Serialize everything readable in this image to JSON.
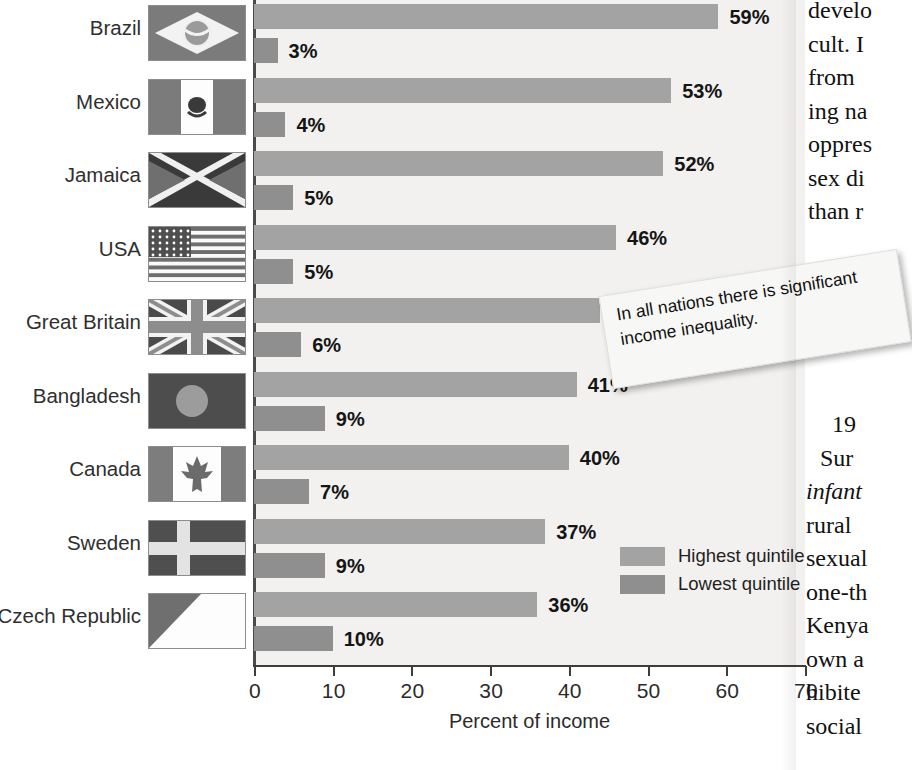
{
  "chart_data": {
    "type": "bar",
    "title": "",
    "xlabel": "Percent of income",
    "ylabel": "",
    "xlim": [
      0,
      70
    ],
    "orientation": "horizontal",
    "grid": false,
    "legend_position": "inside-right",
    "categories": [
      "Brazil",
      "Mexico",
      "Jamaica",
      "USA",
      "Great Britain",
      "Bangladesh",
      "Canada",
      "Sweden",
      "Czech Republic"
    ],
    "tick_labels": [
      "0",
      "10",
      "20",
      "30",
      "40",
      "50",
      "60",
      "70"
    ],
    "tick_values": [
      0,
      10,
      20,
      30,
      40,
      50,
      60,
      70
    ],
    "series": [
      {
        "name": "Highest quintile",
        "color": "#a3a3a3",
        "values": [
          59,
          53,
          52,
          46,
          44,
          41,
          40,
          37,
          36
        ],
        "labels": [
          "59%",
          "53%",
          "52%",
          "46%",
          "44%",
          "41%",
          "40%",
          "37%",
          "36%"
        ]
      },
      {
        "name": "Lowest quintile",
        "color": "#8f8f8f",
        "values": [
          3,
          4,
          5,
          5,
          6,
          9,
          7,
          9,
          10
        ],
        "labels": [
          "3%",
          "4%",
          "5%",
          "5%",
          "6%",
          "9%",
          "7%",
          "9%",
          "10%"
        ]
      }
    ],
    "annotations": [
      "In all nations there is significant income inequality."
    ]
  },
  "axis": {
    "x_title": "Percent of income",
    "ticks": [
      "0",
      "10",
      "20",
      "30",
      "40",
      "50",
      "60",
      "70"
    ]
  },
  "rows": [
    {
      "country": "Brazil",
      "flag": "flag-brazil",
      "high": 59,
      "high_label": "59%",
      "low": 3,
      "low_label": "3%"
    },
    {
      "country": "Mexico",
      "flag": "flag-mexico",
      "high": 53,
      "high_label": "53%",
      "low": 4,
      "low_label": "4%"
    },
    {
      "country": "Jamaica",
      "flag": "flag-jamaica",
      "high": 52,
      "high_label": "52%",
      "low": 5,
      "low_label": "5%"
    },
    {
      "country": "USA",
      "flag": "flag-usa",
      "high": 46,
      "high_label": "46%",
      "low": 5,
      "low_label": "5%"
    },
    {
      "country": "Great Britain",
      "flag": "flag-great-britain",
      "high": 44,
      "high_label": "44%",
      "low": 6,
      "low_label": "6%"
    },
    {
      "country": "Bangladesh",
      "flag": "flag-bangladesh",
      "high": 41,
      "high_label": "41%",
      "low": 9,
      "low_label": "9%"
    },
    {
      "country": "Canada",
      "flag": "flag-canada",
      "high": 40,
      "high_label": "40%",
      "low": 7,
      "low_label": "7%"
    },
    {
      "country": "Sweden",
      "flag": "flag-sweden",
      "high": 37,
      "high_label": "37%",
      "low": 9,
      "low_label": "9%"
    },
    {
      "country": "Czech Republic",
      "flag": "flag-czech-republic",
      "high": 36,
      "high_label": "36%",
      "low": 10,
      "low_label": "10%"
    }
  ],
  "legend": {
    "items": [
      {
        "label": "Highest quintile",
        "color": "#a3a3a3"
      },
      {
        "label": "Lowest quintile",
        "color": "#8f8f8f"
      }
    ]
  },
  "callout": {
    "text": "In all nations there is significant income inequality."
  },
  "book_text": {
    "top_lines": [
      "develo",
      "cult. I",
      "from",
      "ing na",
      "oppres",
      "sex di",
      "than r"
    ],
    "bottom_lines": [
      "19",
      "Sur",
      "infant",
      "rural",
      "sexual",
      "one-th",
      "Kenya",
      "own a",
      "hibite",
      "social"
    ]
  },
  "colors": {
    "highest_quintile": "#a3a3a3",
    "lowest_quintile": "#8f8f8f",
    "plot_background": "#f2f1ef",
    "axis": "#3d3d3d"
  }
}
